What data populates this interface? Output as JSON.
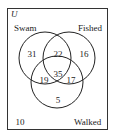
{
  "universe_label": "U",
  "sets": {
    "a": {
      "label": "Swam"
    },
    "b": {
      "label": "Fished"
    },
    "c": {
      "label": "Walked"
    }
  },
  "regions": {
    "only_swam": "31",
    "swam_fished": "22",
    "only_fished": "16",
    "swam_walked": "19",
    "all_three": "35",
    "fished_walked": "17",
    "only_walked": "5",
    "outside": "10"
  }
}
